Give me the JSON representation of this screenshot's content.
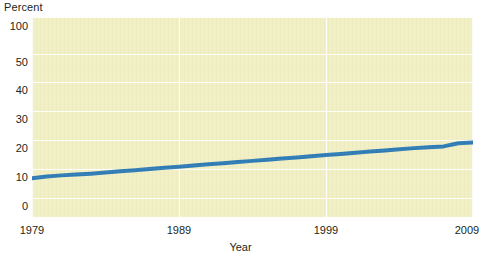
{
  "chart_data": {
    "type": "line",
    "title": "",
    "ylabel": "Percent",
    "xlabel": "Year",
    "x": [
      1979,
      1980,
      1981,
      1982,
      1983,
      1984,
      1985,
      1986,
      1987,
      1988,
      1989,
      1990,
      1991,
      1992,
      1993,
      1994,
      1995,
      1996,
      1997,
      1998,
      1999,
      2000,
      2001,
      2002,
      2003,
      2004,
      2005,
      2006,
      2007,
      2008,
      2009
    ],
    "values": [
      6.8,
      7.4,
      7.8,
      8.1,
      8.4,
      8.8,
      9.2,
      9.6,
      10.0,
      10.4,
      10.8,
      11.2,
      11.6,
      12.0,
      12.4,
      12.8,
      13.2,
      13.6,
      14.0,
      14.4,
      14.8,
      15.2,
      15.6,
      16.0,
      16.4,
      16.8,
      17.2,
      17.5,
      17.8,
      18.9,
      19.1
    ],
    "series": [
      {
        "name": "Percent",
        "color": "#2f7cb6",
        "values": [
          6.8,
          7.4,
          7.8,
          8.1,
          8.4,
          8.8,
          9.2,
          9.6,
          10.0,
          10.4,
          10.8,
          11.2,
          11.6,
          12.0,
          12.4,
          12.8,
          13.2,
          13.6,
          14.0,
          14.4,
          14.8,
          15.2,
          15.6,
          16.0,
          16.4,
          16.8,
          17.2,
          17.5,
          17.8,
          18.9,
          19.1
        ]
      }
    ],
    "y_ticks": [
      "100",
      "50",
      "40",
      "30",
      "20",
      "10",
      "0"
    ],
    "y_tick_values": [
      100,
      50,
      40,
      30,
      20,
      10,
      0
    ],
    "x_ticks": [
      "1979",
      "1989",
      "1999",
      "2009"
    ],
    "x_tick_values": [
      1979,
      1989,
      1999,
      2009
    ],
    "xlim": [
      1979,
      2009
    ],
    "ylim": [
      0,
      100
    ],
    "y_scale": "non-linear",
    "grid": true,
    "legend": "none",
    "plot_background": "#f1efc3",
    "grid_color": "#ffffff",
    "line_color": "#2f7cb6",
    "line_width": 4
  },
  "labels": {
    "y_axis_caption": "Percent",
    "x_axis_caption": "Year",
    "ytick_100": "100",
    "ytick_50": "50",
    "ytick_40": "40",
    "ytick_30": "30",
    "ytick_20": "20",
    "ytick_10": "10",
    "ytick_0": "0",
    "xtick_1979": "1979",
    "xtick_1989": "1989",
    "xtick_1999": "1999",
    "xtick_2009": "2009"
  }
}
